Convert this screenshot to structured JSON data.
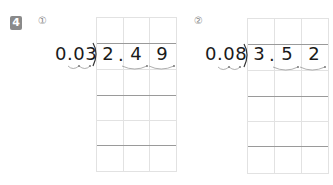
{
  "problem": {
    "number": "4",
    "items": [
      {
        "label": "①",
        "divisor": "0.03",
        "dividend_digits": [
          "2",
          "4",
          "9"
        ],
        "decimal_point": "."
      },
      {
        "label": "②",
        "divisor": "0.08",
        "dividend_digits": [
          "3",
          "5",
          "2"
        ],
        "decimal_point": "."
      }
    ]
  }
}
